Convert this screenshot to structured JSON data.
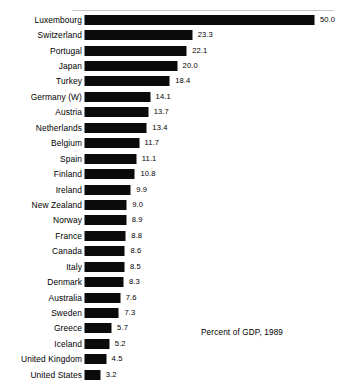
{
  "chart_data": {
    "type": "bar",
    "orientation": "horizontal",
    "title": "",
    "subtitle": "",
    "caption": "Percent of GDP, 1989",
    "xlabel": "",
    "ylabel": "",
    "grid": false,
    "legend": null,
    "xlim": [
      0,
      50.0
    ],
    "axis_visible": false,
    "value_label_format": "one-decimal",
    "bar_color": "#0b0b0b",
    "background_color": "#ffffff",
    "categories": [
      "Luxembourg",
      "Switzerland",
      "Portugal",
      "Japan",
      "Turkey",
      "Germany (W)",
      "Austria",
      "Netherlands",
      "Belgium",
      "Spain",
      "Finland",
      "Ireland",
      "New Zealand",
      "Norway",
      "France",
      "Canada",
      "Italy",
      "Denmark",
      "Australia",
      "Sweden",
      "Greece",
      "Iceland",
      "United Kingdom",
      "United States"
    ],
    "values": [
      50.0,
      23.3,
      22.1,
      20.0,
      18.4,
      14.1,
      13.7,
      13.4,
      11.7,
      11.1,
      10.8,
      9.9,
      9.0,
      8.9,
      8.8,
      8.6,
      8.5,
      8.3,
      7.6,
      7.3,
      5.7,
      5.2,
      4.5,
      3.2
    ],
    "value_labels": [
      "50.0",
      "23.3",
      "22.1",
      "20.0",
      "18.4",
      "14.1",
      "13.7",
      "13.4",
      "11.7",
      "11.1",
      "10.8",
      "9.9",
      "9.0",
      "8.9",
      "8.8",
      "8.6",
      "8.5",
      "8.3",
      "7.6",
      "7.3",
      "5.7",
      "5.2",
      "4.5",
      "3.2"
    ]
  }
}
